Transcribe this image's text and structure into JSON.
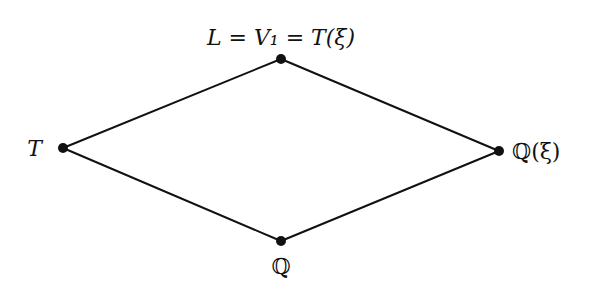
{
  "diagram": {
    "type": "lattice",
    "nodes": [
      {
        "id": "top",
        "label": "L = V₁ = T(ξ)",
        "x": 281,
        "y": 59
      },
      {
        "id": "left",
        "label": "T",
        "x": 63,
        "y": 148
      },
      {
        "id": "right",
        "label": "ℚ(ξ)",
        "x": 499,
        "y": 151
      },
      {
        "id": "bottom",
        "label": "ℚ",
        "x": 281,
        "y": 241
      }
    ],
    "edges": [
      {
        "from": "left",
        "to": "top"
      },
      {
        "from": "top",
        "to": "right"
      },
      {
        "from": "left",
        "to": "bottom"
      },
      {
        "from": "bottom",
        "to": "right"
      }
    ],
    "colors": {
      "line": "#111111",
      "node": "#111111",
      "background": "#ffffff"
    }
  }
}
